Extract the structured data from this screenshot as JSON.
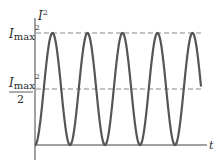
{
  "chart_data": {
    "type": "line",
    "title": "",
    "xlabel": "t",
    "ylabel": "I²",
    "series": [
      {
        "name": "I² vs t",
        "function": "Imax² · sin²(ωt)",
        "periods_shown": 5
      }
    ],
    "reference_lines": [
      {
        "label": "Imax²",
        "value": 1.0,
        "style": "dashed"
      },
      {
        "label": "Imax²/2",
        "value": 0.5,
        "style": "dashed"
      }
    ],
    "ylim": [
      0,
      1
    ],
    "grid": false,
    "legend": "none"
  },
  "labels": {
    "y_axis": "I",
    "y_axis_exp": "2",
    "x_axis": "t",
    "max_main": "I",
    "max_sub": "max",
    "max_exp": "2",
    "half_main": "I",
    "half_sub": "max",
    "half_exp": "2",
    "half_den": "2"
  },
  "colors": {
    "curve": "#555555",
    "axis": "#444444",
    "dashed": "#888888"
  }
}
